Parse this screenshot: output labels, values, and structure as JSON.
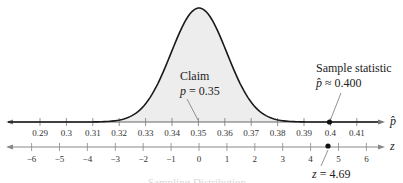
{
  "chart_data": {
    "type": "line",
    "title": "",
    "xlabel": "p̂",
    "xlabel_secondary": "z",
    "ylabel": "",
    "grid": false,
    "legend": null,
    "distribution": {
      "kind": "normal",
      "mean": 0.35,
      "std_error": 0.01066,
      "mean_z": 0,
      "std_z": 1
    },
    "x_range": [
      0.28,
      0.42
    ],
    "z_range": [
      -6.5,
      6.5
    ],
    "p_hat_ticks": [
      "0.29",
      "0.3",
      "0.31",
      "0.32",
      "0.33",
      "0.34",
      "0.35",
      "0.36",
      "0.37",
      "0.38",
      "0.39",
      "0.4",
      "0.41"
    ],
    "z_ticks": [
      "−6",
      "−5",
      "−4",
      "−3",
      "−2",
      "−1",
      "0",
      "1",
      "2",
      "3",
      "4",
      "5",
      "6"
    ],
    "annotations": [
      {
        "label": "Claim",
        "sublabel": "p = 0.35",
        "x": 0.35
      },
      {
        "label": "Sample statistic",
        "sublabel": "p̂ ≈ 0.400",
        "x": 0.4
      },
      {
        "label": "z = 4.69",
        "x_z": 4.69
      }
    ],
    "points": [
      {
        "axis": "p_hat",
        "value": 0.4
      },
      {
        "axis": "z",
        "value": 4.69
      }
    ]
  },
  "labels": {
    "claim_title": "Claim",
    "claim_var": "p",
    "claim_eq": " = 0.35",
    "sample_title": "Sample statistic",
    "sample_var": "p̂",
    "sample_eq": " ≈ 0.400",
    "z_var": "z",
    "z_eq": " = 4.69",
    "axis_phat": "p̂",
    "axis_z": "z",
    "caption": "Sampling Distribution"
  },
  "colors": {
    "curve": "#1a1a1a",
    "fill": "#ececec",
    "axis": "#555555",
    "point": "#111111"
  }
}
